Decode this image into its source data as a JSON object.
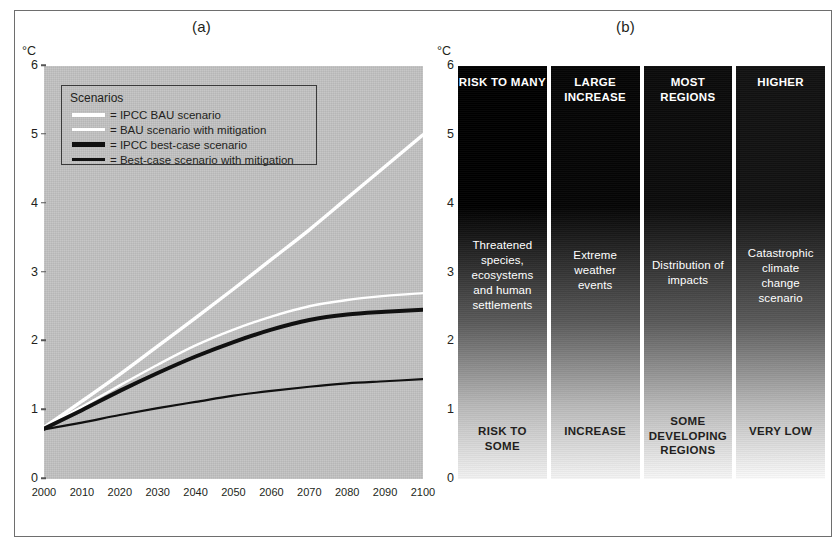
{
  "figure": {
    "panel_a_title": "(a)",
    "panel_b_title": "(b)",
    "unit_label": "°C"
  },
  "chart_data": [
    {
      "type": "line",
      "title": "(a)",
      "xlabel": "",
      "ylabel": "°C",
      "xlim": [
        2000,
        2100
      ],
      "ylim": [
        0,
        6
      ],
      "yticks": [
        0,
        1,
        2,
        3,
        4,
        5,
        6
      ],
      "grid": false,
      "plot_background": "#c3c3c3",
      "legend": {
        "title": "Scenarios",
        "position": "top-left-inside",
        "entries": [
          {
            "label": "= IPCC BAU scenario",
            "color": "#ffffff",
            "width": "thick"
          },
          {
            "label": "= BAU scenario with mitigation",
            "color": "#ffffff",
            "width": "thin"
          },
          {
            "label": "= IPCC best-case scenario",
            "color": "#111111",
            "width": "thick"
          },
          {
            "label": "= Best-case scenario with mitigation",
            "color": "#111111",
            "width": "thin"
          }
        ]
      },
      "x": [
        2000,
        2010,
        2020,
        2030,
        2040,
        2050,
        2060,
        2070,
        2080,
        2090,
        2100
      ],
      "xticklabels": [
        "2000",
        "2010",
        "2020",
        "2030",
        "2040",
        "2050",
        "2060",
        "2070",
        "2080",
        "2090",
        "2100"
      ],
      "series": [
        {
          "name": "IPCC BAU scenario",
          "color": "#ffffff",
          "width": 3.4,
          "values": [
            0.75,
            1.13,
            1.52,
            1.93,
            2.34,
            2.76,
            3.19,
            3.62,
            4.08,
            4.54,
            5.0
          ]
        },
        {
          "name": "BAU scenario with mitigation",
          "color": "#ffffff",
          "width": 2.4,
          "values": [
            0.75,
            1.05,
            1.36,
            1.66,
            1.94,
            2.17,
            2.36,
            2.51,
            2.6,
            2.66,
            2.7
          ]
        },
        {
          "name": "IPCC best-case scenario",
          "color": "#111111",
          "width": 4.0,
          "values": [
            0.73,
            1.0,
            1.28,
            1.54,
            1.78,
            1.99,
            2.17,
            2.31,
            2.39,
            2.43,
            2.46
          ]
        },
        {
          "name": "Best-case scenario with mitigation",
          "color": "#111111",
          "width": 2.2,
          "values": [
            0.72,
            0.82,
            0.93,
            1.03,
            1.12,
            1.21,
            1.28,
            1.34,
            1.39,
            1.42,
            1.45
          ]
        }
      ]
    },
    {
      "type": "heatmap",
      "title": "(b)",
      "ylabel": "°C",
      "ylim": [
        0,
        6
      ],
      "yticks": [
        0,
        1,
        2,
        3,
        4,
        5,
        6
      ],
      "note": "Four vertical gradient bars, dark (high risk) at top to light at bottom",
      "columns": [
        {
          "header": "RISK TO MANY",
          "middle": "Threatened species, ecosystems and human settlements",
          "footer": "RISK TO SOME",
          "top_color": "#000000",
          "bottom_color": "#f2f2f2"
        },
        {
          "header": "LARGE INCREASE",
          "middle": "Extreme weather events",
          "footer": "INCREASE",
          "top_color": "#050505",
          "bottom_color": "#f4f4f4"
        },
        {
          "header": "MOST REGIONS",
          "middle": "Distribution of impacts",
          "footer": "SOME DEVELOPING REGIONS",
          "top_color": "#0b0b0b",
          "bottom_color": "#f7f7f7"
        },
        {
          "header": "HIGHER",
          "middle": "Catastrophic climate change scenario",
          "footer": "VERY LOW",
          "top_color": "#121212",
          "bottom_color": "#fbfbfb"
        }
      ]
    }
  ],
  "panel_a": {
    "yticks": [
      "6",
      "5",
      "4",
      "3",
      "2",
      "1",
      "0"
    ],
    "xticks": [
      "2000",
      "2010",
      "2020",
      "2030",
      "2040",
      "2050",
      "2060",
      "2070",
      "2080",
      "2090",
      "2100"
    ],
    "legend": {
      "title": "Scenarios",
      "items": [
        {
          "label": "= IPCC BAU scenario"
        },
        {
          "label": "= BAU scenario with mitigation"
        },
        {
          "label": "= IPCC best-case scenario"
        },
        {
          "label": "= Best-case scenario with mitigation"
        }
      ]
    }
  },
  "panel_b": {
    "yticks": [
      "6",
      "5",
      "4",
      "3",
      "2",
      "1",
      "0"
    ],
    "columns": [
      {
        "header": "RISK TO MANY",
        "middle": "Threatened species, ecosystems and human settlements",
        "footer": "RISK TO SOME"
      },
      {
        "header": "LARGE INCREASE",
        "middle": "Extreme weather events",
        "footer": "INCREASE"
      },
      {
        "header": "MOST REGIONS",
        "middle": "Distribution of impacts",
        "footer": "SOME DEVELOPING REGIONS"
      },
      {
        "header": "HIGHER",
        "middle": "Catastrophic climate change scenario",
        "footer": "VERY LOW"
      }
    ]
  }
}
